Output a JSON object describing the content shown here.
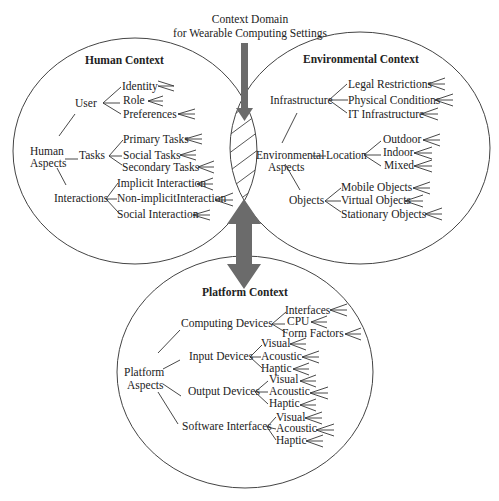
{
  "title": {
    "line1": "Context Domain",
    "line2": "for Wearable Computing Settings"
  },
  "colors": {
    "arrow": "#6b6b6b",
    "stroke": "#444444",
    "text": "#222222",
    "background": "#ffffff"
  },
  "human": {
    "heading": "Human Context",
    "root": [
      "Human",
      "Aspects"
    ],
    "groups": [
      {
        "label": "User",
        "items": [
          "Identity",
          "Role",
          "Preferences"
        ]
      },
      {
        "label": "Tasks",
        "items": [
          "Primary Tasks",
          "Social Tasks",
          "Secondary Tasks"
        ]
      },
      {
        "label": "Interactions",
        "items": [
          "Implicit Interaction",
          "Non-implicitInteraction",
          "Social Interaction"
        ]
      }
    ]
  },
  "environment": {
    "heading": "Environmental Context",
    "root": [
      "Environmental",
      "Aspects"
    ],
    "groups": [
      {
        "label": "Infrastructure",
        "items": [
          "Legal Restrictions",
          "Physical Conditions",
          "IT Infrastructure"
        ]
      },
      {
        "label": "Location",
        "items": [
          "Outdoor",
          "Indoor",
          "Mixed"
        ]
      },
      {
        "label": "Objects",
        "items": [
          "Mobile Objects",
          "Virtual Objects",
          "Stationary Objects"
        ]
      }
    ]
  },
  "platform": {
    "heading": "Platform Context",
    "root": [
      "Platform",
      "Aspects"
    ],
    "groups": [
      {
        "label": "Computing Devices",
        "items": [
          "Interfaces",
          "CPU",
          "Form Factors"
        ]
      },
      {
        "label": "Input Devices",
        "items": [
          "Visual",
          "Acoustic",
          "Haptic"
        ]
      },
      {
        "label": "Output Devices",
        "items": [
          "Visual",
          "Acoustic",
          "Haptic"
        ]
      },
      {
        "label": "Software Interfaces",
        "items": [
          "Visual",
          "Acoustic",
          "Haptic"
        ]
      }
    ]
  }
}
